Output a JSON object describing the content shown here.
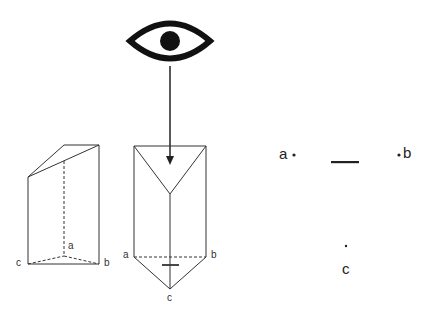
{
  "diagram": {
    "left_prism": {
      "labels": {
        "a": "a",
        "b": "b",
        "c": "c"
      }
    },
    "front_prism": {
      "labels": {
        "a": "a",
        "b": "b",
        "c": "c"
      }
    },
    "top_view": {
      "labels": {
        "a": "a",
        "b": "b",
        "c": "c"
      }
    },
    "icons": [
      "eye-icon",
      "arrow-down"
    ],
    "colors": {
      "stroke": "#222222",
      "background": "#ffffff"
    }
  }
}
